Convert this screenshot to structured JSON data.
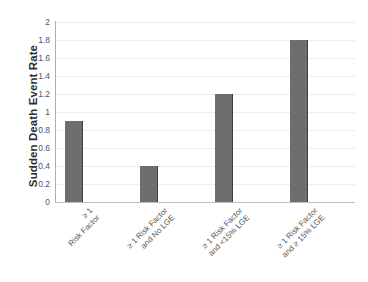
{
  "chart_data": {
    "type": "bar",
    "title": "",
    "xlabel": "",
    "ylabel": "Sudden Death Event Rate",
    "ylim": [
      0,
      2
    ],
    "grid": true,
    "legend": "none",
    "categories": [
      "≥ 1 Risk Factor",
      "≥ 1 Risk Factor and No LGE",
      "≥ 1 Risk Factor and <15% LGE",
      "≥ 1 Risk Factor and ≥ 15% LGE"
    ],
    "category_lines": [
      [
        "≥ 1",
        "Risk Factor"
      ],
      [
        "≥ 1 Risk Factor",
        "and No LGE"
      ],
      [
        "≥ 1 Risk Factor",
        "and <15% LGE"
      ],
      [
        "≥ 1 Risk Factor",
        "and ≥ 15% LGE"
      ]
    ],
    "values": [
      0.9,
      0.4,
      1.2,
      1.8
    ],
    "ytick_labels": [
      "2",
      "1.8",
      "1.6",
      "1.4",
      "1.2",
      "1",
      "0.8",
      "0.6",
      "0.4",
      "0.2",
      "0"
    ],
    "ytick_values": [
      2,
      1.8,
      1.6,
      1.4,
      1.2,
      1,
      0.8,
      0.6,
      0.4,
      0.2,
      0
    ],
    "bar_color": "#6e6e6e",
    "gridline_color": "#ededed",
    "axis_color": "#aeaeae",
    "background_color": "#ffffff"
  }
}
